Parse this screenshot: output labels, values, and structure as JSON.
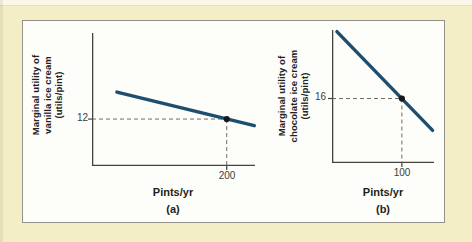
{
  "colors": {
    "background": "#f4eec6",
    "panel": "#fdfdfa",
    "panel_border": "#92928a",
    "line": "#1d4e6e",
    "axis": "#45453f",
    "dashed": "#6e6e68",
    "point": "#15181c",
    "text": "#22221e",
    "tick_text": "#3c3c38"
  },
  "figure": {
    "panels": [
      {
        "label": "(a)",
        "y_axis_label_lines": [
          "Marginal utility of",
          "vanilla ice cream",
          "(utils/pint)"
        ],
        "x_axis_label": "Pints/yr",
        "y_tick_label": "12",
        "x_tick_label": "200"
      },
      {
        "label": "(b)",
        "y_axis_label_lines": [
          "Marginal utility of",
          "chocolate ice cream",
          "(utils/pint)"
        ],
        "x_axis_label": "Pints/yr",
        "y_tick_label": "16",
        "x_tick_label": "100"
      }
    ]
  },
  "chart_data": [
    {
      "type": "line",
      "panel": "(a)",
      "title": "",
      "xlabel": "Pints/yr",
      "ylabel": "Marginal utility of vanilla ice cream (utils/pint)",
      "xlim": [
        0,
        242
      ],
      "ylim": [
        0,
        34
      ],
      "xticks": [
        200
      ],
      "yticks": [
        12
      ],
      "grid": false,
      "line": {
        "x1": 37,
        "y1": 18.9,
        "x2": 241,
        "y2": 10.3
      },
      "marked_point": {
        "x": 200,
        "y": 12
      },
      "annotation": "Dashed guide lines from both axes meet the curve at (200, 12)"
    },
    {
      "type": "line",
      "panel": "(b)",
      "title": "",
      "xlabel": "Pints/yr",
      "ylabel": "Marginal utility of chocolate ice cream (utils/pint)",
      "xlim": [
        0,
        146
      ],
      "ylim": [
        0,
        33
      ],
      "xticks": [
        100
      ],
      "yticks": [
        16
      ],
      "grid": false,
      "line": {
        "x1": 7,
        "y1": 32.6,
        "x2": 144,
        "y2": 8.1
      },
      "marked_point": {
        "x": 100,
        "y": 16
      },
      "annotation": "Dashed guide lines from both axes meet the curve at (100, 16)"
    }
  ]
}
